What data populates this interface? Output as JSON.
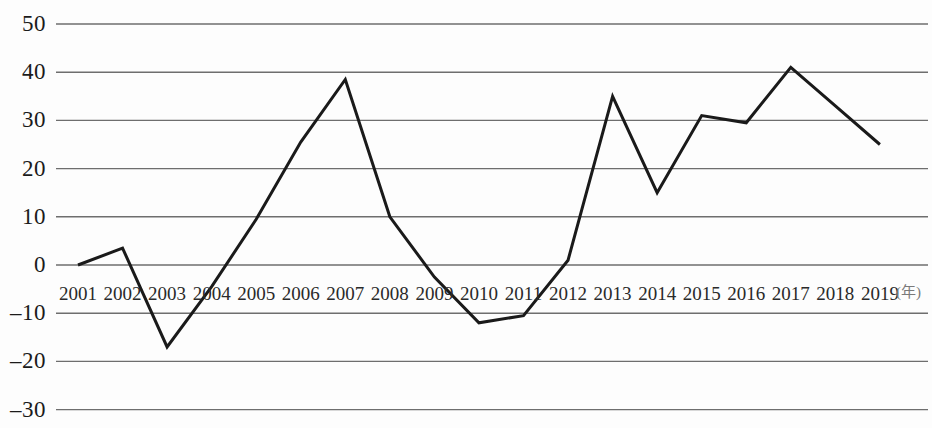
{
  "chart_data": {
    "type": "line",
    "title": "",
    "subtitle": "",
    "xlabel": "(年)",
    "ylabel": "",
    "categories": [
      "2001",
      "2002",
      "2003",
      "2004",
      "2005",
      "2006",
      "2007",
      "2008",
      "2009",
      "2010",
      "2011",
      "2012",
      "2013",
      "2014",
      "2015",
      "2016",
      "2017",
      "2018",
      "2019"
    ],
    "values": [
      0,
      3.5,
      -17,
      -4.5,
      9.5,
      25.5,
      38.5,
      10,
      -2.5,
      -12,
      -10.5,
      1,
      35,
      15,
      31,
      29.5,
      41,
      33,
      25
    ],
    "series": [
      {
        "name": "",
        "values": [
          0,
          3.5,
          -17,
          -4.5,
          9.5,
          25.5,
          38.5,
          10,
          -2.5,
          -12,
          -10.5,
          1,
          35,
          15,
          31,
          29.5,
          41,
          33,
          25
        ]
      }
    ],
    "ylim": [
      -30,
      50
    ],
    "ytick_values": [
      50,
      40,
      30,
      20,
      10,
      0,
      -10,
      -20,
      -30
    ],
    "ytick_labels": [
      "50",
      "40",
      "30",
      "20",
      "10",
      "0",
      "–10",
      "–20",
      "–30"
    ],
    "grid": true,
    "grid_axis": "y",
    "legend": false,
    "legend_position": "none",
    "line_color": "#1a1a1a",
    "grid_color": "#6e6e6e",
    "background_color": "#fdfdfd",
    "markers": false,
    "annotations": []
  },
  "axis": {
    "x_unit_label": "(年)"
  }
}
